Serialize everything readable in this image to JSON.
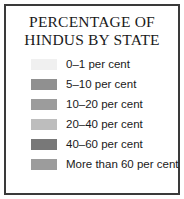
{
  "legend": {
    "title_line1": "PERCENTAGE OF",
    "title_line2": "HINDUS BY STATE",
    "border_color": "#3a3a3a",
    "background_color": "#ffffff",
    "text_color": "#1a1a1a"
  },
  "chart_data": {
    "type": "table",
    "title": "PERCENTAGE OF HINDUS BY STATE",
    "xlabel": "",
    "ylabel": "",
    "legend_position": "standalone",
    "grid": false,
    "categories": [
      "0–1 per cent",
      "5–10 per cent",
      "10–20 per cent",
      "20–40 per cent",
      "40–60 per cent",
      "More than 60 per cent"
    ],
    "values": [
      0.5,
      7.5,
      15,
      30,
      50,
      80
    ],
    "bins": [
      {
        "label": "0–1 per cent",
        "min": 0,
        "max": 1,
        "color": "#f0f0f0"
      },
      {
        "label": "5–10 per cent",
        "min": 5,
        "max": 10,
        "color": "#909090"
      },
      {
        "label": "10–20 per cent",
        "min": 10,
        "max": 20,
        "color": "#9c9c9c"
      },
      {
        "label": "20–40 per cent",
        "min": 20,
        "max": 40,
        "color": "#bdbdbd"
      },
      {
        "label": "40–60 per cent",
        "min": 40,
        "max": 60,
        "color": "#787878"
      },
      {
        "label": "More than 60 per cent",
        "min": 60,
        "max": 100,
        "color": "#9c9c9c"
      }
    ]
  }
}
